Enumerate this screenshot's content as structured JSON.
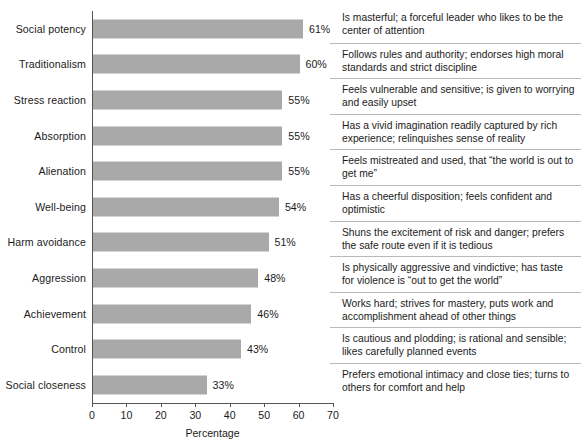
{
  "chart_data": {
    "type": "bar",
    "orientation": "horizontal",
    "title": "",
    "xlabel": "Percentage",
    "ylabel": "",
    "xlim": [
      0,
      70
    ],
    "xticks": [
      0,
      10,
      20,
      30,
      40,
      50,
      60,
      70
    ],
    "grid": false,
    "legend": null,
    "bar_color": "#a9a9a9",
    "categories": [
      "Social potency",
      "Traditionalism",
      "Stress reaction",
      "Absorption",
      "Alienation",
      "Well-being",
      "Harm avoidance",
      "Aggression",
      "Achievement",
      "Control",
      "Social closeness"
    ],
    "values": [
      61,
      60,
      55,
      55,
      55,
      54,
      51,
      48,
      46,
      43,
      33
    ],
    "value_labels": [
      "61%",
      "60%",
      "55%",
      "55%",
      "55%",
      "54%",
      "51%",
      "48%",
      "46%",
      "43%",
      "33%"
    ],
    "annotations": [
      "Is masterful; a forceful leader who likes to be the center of attention",
      "Follows rules and authority; endorses high moral standards and strict discipline",
      "Feels vulnerable and sensitive; is given to worrying and easily upset",
      "Has a vivid imagination readily captured by rich experience; relinquishes sense of reality",
      "Feels mistreated and used, that “the world is out to get me”",
      "Has a cheerful disposition; feels confident and optimistic",
      "Shuns the excitement of risk and danger; prefers the safe route even if it is tedious",
      "Is physically aggressive and vindictive; has taste for violence is “out to get the world”",
      "Works hard; strives for mastery, puts work and accomplishment ahead of other things",
      "Is cautious and plodding; is rational and sensible; likes carefully planned events",
      "Prefers emotional intimacy and close ties; turns to others for comfort and help"
    ]
  }
}
